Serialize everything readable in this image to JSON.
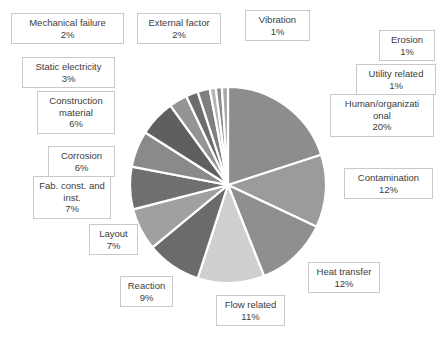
{
  "chart_data": {
    "type": "pie",
    "title": "",
    "subtitle": "",
    "xlabel": "",
    "ylabel": "",
    "legend": "none",
    "grid": false,
    "units": "percent",
    "start_angle_deg": 0,
    "direction": "clockwise",
    "total": 100,
    "categories": [
      "Human/organizational",
      "Contamination",
      "Heat transfer",
      "Flow related",
      "Reaction",
      "Layout",
      "Fab. const. and inst.",
      "Corrosion",
      "Construction material",
      "Static electricity",
      "Mechanical failure",
      "External factor",
      "Vibration",
      "Erosion",
      "Utility related"
    ],
    "values": [
      20,
      12,
      12,
      11,
      9,
      7,
      7,
      6,
      6,
      3,
      2,
      2,
      1,
      1,
      1
    ],
    "value_labels": [
      "20%",
      "12%",
      "12%",
      "11%",
      "9%",
      "7%",
      "7%",
      "6%",
      "6%",
      "3%",
      "2%",
      "2%",
      "1%",
      "1%",
      "1%"
    ],
    "colors": [
      "#8d8d8d",
      "#9b9b9b",
      "#8f8f8f",
      "#cfcfcf",
      "#6b6b6b",
      "#a0a0a0",
      "#6f6f6f",
      "#8a8a8a",
      "#5f5f5f",
      "#949494",
      "#6d6d6d",
      "#7f7f7f",
      "#b5b5b5",
      "#8b8b8b",
      "#a8a8a8"
    ],
    "slice_border_color": "#ffffff"
  },
  "labels": [
    {
      "name": "Mechanical failure",
      "value": "2%"
    },
    {
      "name": "External factor",
      "value": "2%"
    },
    {
      "name": "Vibration",
      "value": "1%"
    },
    {
      "name": "Erosion",
      "value": "1%"
    },
    {
      "name": "Static electricity",
      "value": "3%"
    },
    {
      "name": "Utility related",
      "value": "1%"
    },
    {
      "name": "Construction material",
      "value": "6%"
    },
    {
      "name": "Human/organizati onal",
      "value": "20%"
    },
    {
      "name": "Corrosion",
      "value": "6%"
    },
    {
      "name": "Contamination",
      "value": "12%"
    },
    {
      "name": "Fab. const. and inst.",
      "value": "7%"
    },
    {
      "name": "Layout",
      "value": "7%"
    },
    {
      "name": "Heat transfer",
      "value": "12%"
    },
    {
      "name": "Reaction",
      "value": "9%"
    },
    {
      "name": "Flow related",
      "value": "11%"
    }
  ]
}
